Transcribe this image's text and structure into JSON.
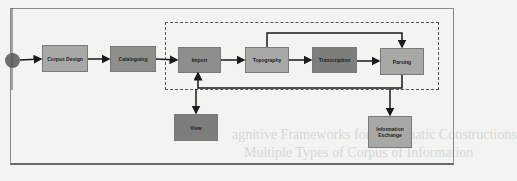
{
  "diagram": {
    "start_node": "start",
    "nodes": [
      {
        "id": "corpus_design",
        "label": "Corpus Design",
        "shade": "light"
      },
      {
        "id": "cataloguing",
        "label": "Cataloguing",
        "shade": "mid"
      },
      {
        "id": "import",
        "label": "Import",
        "shade": "mid"
      },
      {
        "id": "topography",
        "label": "Topography",
        "shade": "light"
      },
      {
        "id": "transcription",
        "label": "Transcription",
        "shade": "dark"
      },
      {
        "id": "parsing",
        "label": "Parsing",
        "shade": "light"
      },
      {
        "id": "view",
        "label": "View",
        "shade": "dark"
      },
      {
        "id": "information_exchange",
        "label": "Information Exchange",
        "shade": "light"
      }
    ],
    "edges": [
      {
        "from": "start",
        "to": "corpus_design"
      },
      {
        "from": "corpus_design",
        "to": "cataloguing"
      },
      {
        "from": "cataloguing",
        "to": "import"
      },
      {
        "from": "import",
        "to": "topography"
      },
      {
        "from": "topography",
        "to": "transcription"
      },
      {
        "from": "transcription",
        "to": "parsing"
      },
      {
        "from": "topography",
        "to": "parsing"
      },
      {
        "from": "parsing",
        "to": "import"
      },
      {
        "from": "dashed_group",
        "to": "view"
      },
      {
        "from": "dashed_group",
        "to": "information_exchange"
      }
    ],
    "group": {
      "label": "",
      "members": [
        "import",
        "topography",
        "transcription",
        "parsing"
      ]
    }
  },
  "bleed_through": {
    "line1": "agnitive Frameworks for Systematic Constructions",
    "line2": "Multiple Types of Corpus of Information"
  }
}
